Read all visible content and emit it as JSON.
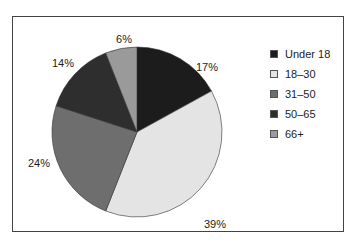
{
  "chart_data": {
    "type": "pie",
    "title": "",
    "categories": [
      "Under 18",
      "18–30",
      "31–50",
      "50–65",
      "66+"
    ],
    "values": [
      17,
      39,
      24,
      14,
      6
    ],
    "labels": [
      "17%",
      "39%",
      "24%",
      "14%",
      "6%"
    ],
    "colors": [
      "#1c1c1c",
      "#e4e4e4",
      "#6e6e6e",
      "#2e2e2e",
      "#9a9a9a"
    ],
    "start_angle": "top, clockwise",
    "legend_position": "right"
  },
  "legend": {
    "items": [
      {
        "label": "Under 18",
        "color": "#1c1c1c"
      },
      {
        "label": "18–30",
        "color": "#e4e4e4"
      },
      {
        "label": "31–50",
        "color": "#6e6e6e"
      },
      {
        "label": "50–65",
        "color": "#2e2e2e"
      },
      {
        "label": "66+",
        "color": "#9a9a9a"
      }
    ]
  }
}
